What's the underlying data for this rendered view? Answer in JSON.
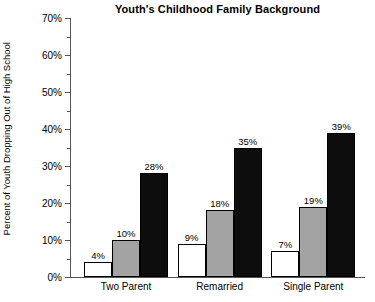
{
  "chart_data": {
    "type": "bar",
    "title": "Youth's Childhood Family Background",
    "xlabel": "",
    "ylabel": "Percent of Youth Dropping Out of High School",
    "categories": [
      "Two Parent",
      "Remarried",
      "Single Parent"
    ],
    "series": [
      {
        "name": "series-1",
        "fill": "white",
        "values": [
          4,
          9,
          7
        ]
      },
      {
        "name": "series-2",
        "fill": "gray",
        "values": [
          10,
          18,
          19
        ]
      },
      {
        "name": "series-3",
        "fill": "black",
        "values": [
          28,
          35,
          39
        ]
      }
    ],
    "value_labels": [
      [
        "4%",
        "9%",
        "7%"
      ],
      [
        "10%",
        "18%",
        "19%"
      ],
      [
        "28%",
        "35%",
        "39%"
      ]
    ],
    "ylim": [
      0,
      70
    ],
    "y_major_ticks": [
      0,
      10,
      20,
      30,
      40,
      50,
      60,
      70
    ],
    "y_major_tick_labels": [
      "0%",
      "10%",
      "20%",
      "30%",
      "40%",
      "50%",
      "60%",
      "70%"
    ],
    "y_minor_ticks": [
      5,
      15,
      25,
      35,
      45,
      55,
      65
    ],
    "grid": false,
    "legend": "none",
    "colors": {
      "series_1": "#ffffff",
      "series_2": "#a3a3a3",
      "series_3": "#0d0d0d",
      "axis": "#555555",
      "text": "#000000",
      "background": "#ffffff"
    }
  }
}
